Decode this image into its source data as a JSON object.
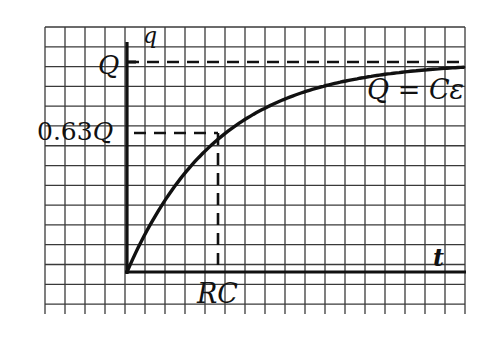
{
  "chart_data": {
    "type": "line",
    "title": "",
    "xlabel": "t",
    "ylabel": "q",
    "grid": true,
    "legend": null,
    "function": "q = Q(1 - e^(-t/RC))",
    "x_ticks": [
      {
        "label": "RC",
        "value": 1
      }
    ],
    "y_ticks": [
      {
        "label": "Q",
        "value": 1.0
      },
      {
        "label": "0.63Q",
        "value": 0.63
      }
    ],
    "series": [
      {
        "name": "charging curve",
        "x_units_of_RC": [
          0,
          0.25,
          0.5,
          0.75,
          1,
          1.5,
          2,
          2.5,
          3,
          3.5,
          3.7
        ],
        "q_fraction_of_Q": [
          0,
          0.221,
          0.393,
          0.528,
          0.632,
          0.777,
          0.865,
          0.918,
          0.95,
          0.97,
          0.975
        ]
      }
    ],
    "annotations": [
      {
        "text": "Q = Cε",
        "position": "upper right, below asymptote"
      },
      {
        "text": "dashed asymptote at q = Q"
      },
      {
        "text": "dashed guide lines from (RC, 0.63Q) to both axes"
      }
    ],
    "xlim": [
      0,
      3.7
    ],
    "ylim": [
      0,
      1.0
    ]
  },
  "labels": {
    "y_axis": "q",
    "x_axis": "t",
    "q_max": "Q",
    "q_063": "0.63Q",
    "rc": "RC",
    "equation": "Q = Cε"
  },
  "colors": {
    "ink": "#111111",
    "grid": "#3a3a3a",
    "background": "#ffffff"
  }
}
